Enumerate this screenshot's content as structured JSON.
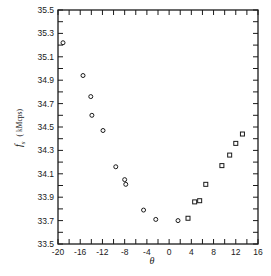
{
  "chart_data": {
    "type": "scatter",
    "title": "",
    "xlabel": "θ",
    "ylabel": "f_s (kMcps)",
    "xlim": [
      -20,
      16
    ],
    "ylim": [
      33.5,
      35.5
    ],
    "x_ticks": [
      -20,
      -16,
      -12,
      -8,
      -4,
      0,
      4,
      8,
      12,
      16
    ],
    "x_tick_labels": [
      "-20",
      "-16",
      "-12",
      "-8",
      "-4",
      "0",
      "4",
      "8",
      "12",
      "16"
    ],
    "x_minor_step": 2,
    "y_ticks": [
      33.5,
      33.7,
      33.9,
      34.1,
      34.3,
      34.5,
      34.7,
      34.9,
      35.1,
      35.3,
      35.5
    ],
    "y_tick_labels": [
      "33.5",
      "33.7",
      "33.9",
      "34.1",
      "34.3",
      "34.5",
      "34.7",
      "34.9",
      "35.1",
      "35.3",
      "35.5"
    ],
    "y_minor_step": 0.1,
    "grid": false,
    "legend": null,
    "series": [
      {
        "name": "circles",
        "marker": "circle",
        "points": [
          {
            "x": -19.1,
            "y": 35.22
          },
          {
            "x": -15.5,
            "y": 34.94
          },
          {
            "x": -14.1,
            "y": 34.76
          },
          {
            "x": -13.9,
            "y": 34.6
          },
          {
            "x": -11.9,
            "y": 34.47
          },
          {
            "x": -9.6,
            "y": 34.16
          },
          {
            "x": -8.0,
            "y": 34.05
          },
          {
            "x": -7.8,
            "y": 34.01
          },
          {
            "x": -4.6,
            "y": 33.79
          },
          {
            "x": -2.4,
            "y": 33.71
          },
          {
            "x": 1.6,
            "y": 33.7
          }
        ]
      },
      {
        "name": "squares",
        "marker": "square",
        "points": [
          {
            "x": 3.4,
            "y": 33.72
          },
          {
            "x": 4.6,
            "y": 33.86
          },
          {
            "x": 5.5,
            "y": 33.87
          },
          {
            "x": 6.6,
            "y": 34.01
          },
          {
            "x": 9.5,
            "y": 34.17
          },
          {
            "x": 10.9,
            "y": 34.26
          },
          {
            "x": 12.0,
            "y": 34.36
          },
          {
            "x": 13.2,
            "y": 34.44
          }
        ]
      }
    ]
  },
  "style": {
    "ink_color": "#1a1a1a",
    "background": "#ffffff"
  },
  "labels": {
    "x_axis": "θ",
    "y_axis_main": "f",
    "y_axis_sub": "s",
    "y_axis_units": "( kMcps)"
  }
}
